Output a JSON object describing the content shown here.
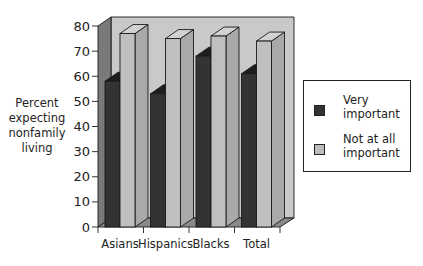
{
  "chart_data": {
    "type": "bar",
    "title": "",
    "xlabel": "",
    "ylabel": "Percent expecting nonfamily living",
    "ylabel_lines": [
      "Percent",
      "expecting",
      "nonfamily",
      "living"
    ],
    "categories": [
      "Asians",
      "Hispanics",
      "Blacks",
      "Total"
    ],
    "series": [
      {
        "name": "Very important",
        "values": [
          58,
          53,
          68,
          61
        ],
        "color": "#333333"
      },
      {
        "name": "Not at all important",
        "values": [
          77,
          75,
          76,
          74
        ],
        "color": "#bdbdbd"
      }
    ],
    "ylim": [
      0,
      80
    ],
    "yticks": [
      0,
      10,
      20,
      30,
      40,
      50,
      60,
      70,
      80
    ],
    "grid": false,
    "legend_position": "right",
    "style": "3d-clustered"
  },
  "legend": {
    "items": [
      {
        "label_lines": [
          "Very",
          "important"
        ],
        "color": "#333333"
      },
      {
        "label_lines": [
          "Not at all",
          "important"
        ],
        "color": "#bdbdbd"
      }
    ]
  },
  "colors": {
    "back_wall": "#c9c9c9",
    "left_wall": "#7a7a7a",
    "floor": "#8a8a8a",
    "dark_front": "#333333",
    "dark_side": "#262626",
    "dark_top": "#1e1e1e",
    "light_front": "#bfbfbf",
    "light_side": "#a9a9a9",
    "light_top": "#d2d2d2",
    "outline": "#1a1a1a"
  }
}
